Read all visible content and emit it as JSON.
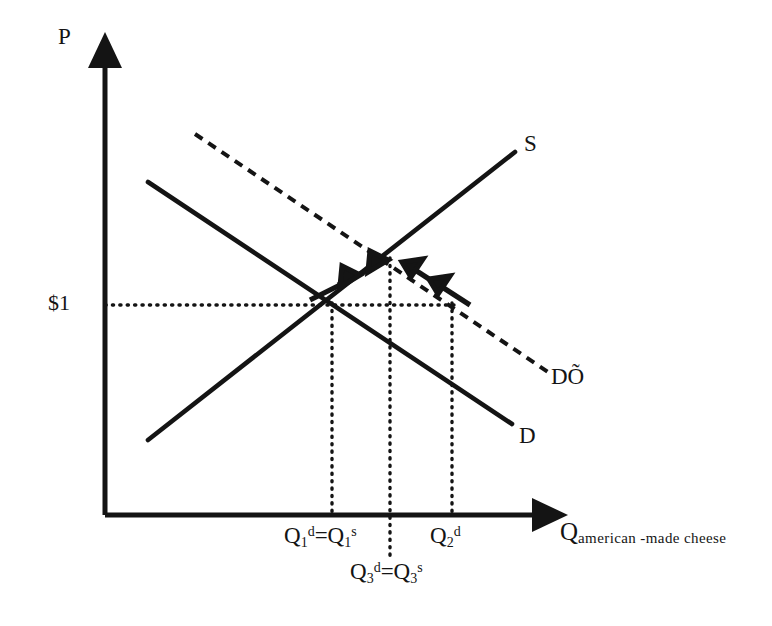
{
  "figure": {
    "type": "supply-demand-diagram",
    "title_visible": false,
    "background": "#ffffff",
    "ink_color": "#141414"
  },
  "axes": {
    "vertical": {
      "name": "price-axis",
      "label": "P",
      "label_pos": [
        62,
        30
      ],
      "from": [
        105,
        515
      ],
      "to": [
        105,
        55
      ],
      "arrowhead": true
    },
    "horizontal": {
      "name": "quantity-axis",
      "label_main": "Q",
      "label_subscript": "american -made cheese",
      "label_pos": [
        560,
        522
      ],
      "from": [
        105,
        515
      ],
      "to": [
        545,
        515
      ],
      "arrowhead": true
    }
  },
  "price_marker": {
    "label": "$1",
    "y": 305,
    "dotted_line_from": [
      105,
      305
    ],
    "dotted_line_to": [
      455,
      305
    ]
  },
  "curves": [
    {
      "name": "supply-curve",
      "label": "S",
      "style": "solid",
      "from": [
        148,
        440
      ],
      "to": [
        515,
        152
      ],
      "label_pos": [
        525,
        143
      ]
    },
    {
      "name": "demand-curve",
      "label": "D",
      "style": "solid",
      "from": [
        148,
        182
      ],
      "to": [
        512,
        424
      ],
      "label_pos": [
        521,
        427
      ]
    },
    {
      "name": "shifted-demand-curve",
      "label": "DÕ",
      "style": "dashed",
      "from": [
        195,
        134
      ],
      "to": [
        548,
        372
      ],
      "label_pos": [
        552,
        372
      ]
    }
  ],
  "equilibria": [
    {
      "name": "original-equilibrium",
      "point": [
        332,
        305
      ],
      "quantity_label": "Q",
      "quantity_sub_d": "1",
      "quantity_sup_d": "d",
      "quantity_sub_s": "1",
      "quantity_sup_s": "s",
      "full_label": "Q1d=Q1s",
      "label_pos": [
        288,
        530
      ]
    },
    {
      "name": "new-equilibrium",
      "point": [
        390,
        262
      ],
      "full_label": "Q3d=Q3s",
      "label_pos": [
        352,
        565
      ]
    }
  ],
  "quantity_markers": [
    {
      "name": "q1-dropline",
      "x": 332,
      "top": 305,
      "bottom": 515,
      "label": "Q1d=Q1s",
      "label_parts": {
        "base": "Q",
        "sub1": "1",
        "sup1": "d",
        "eq": "=",
        "base2": "Q",
        "sub2": "1",
        "sup2": "s"
      },
      "label_pos": [
        288,
        530
      ]
    },
    {
      "name": "q3-dropline",
      "x": 390,
      "top": 262,
      "bottom": 557,
      "label": "Q3d=Q3s",
      "label_parts": {
        "base": "Q",
        "sub1": "3",
        "sup1": "d",
        "eq": "=",
        "base2": "Q",
        "sub2": "3",
        "sup2": "s"
      },
      "label_pos": [
        352,
        565
      ]
    },
    {
      "name": "q2-dropline",
      "x": 452,
      "top": 305,
      "bottom": 515,
      "label": "Q2d",
      "label_parts": {
        "base": "Q",
        "sub1": "2",
        "sup1": "d",
        "eq": "",
        "base2": "",
        "sub2": "",
        "sup2": ""
      },
      "label_pos": [
        432,
        530
      ]
    }
  ],
  "adjustment_arrows": {
    "name": "adjustment-arrows",
    "description": "two pairs of arrows converging on the new equilibrium",
    "left_group": {
      "name": "supply-adjustment-arrows",
      "direction": "up-right",
      "count": 2,
      "along": "supply-curve"
    },
    "right_group": {
      "name": "demand-adjustment-arrows",
      "direction": "up-left",
      "count": 2,
      "along": "shifted-demand-curve"
    }
  },
  "labels": {
    "p_axis": "P",
    "q_axis_base": "Q",
    "q_axis_sub": "american -made cheese",
    "supply": "S",
    "demand": "D",
    "demand_shifted": "DÕ",
    "price": "$1"
  }
}
